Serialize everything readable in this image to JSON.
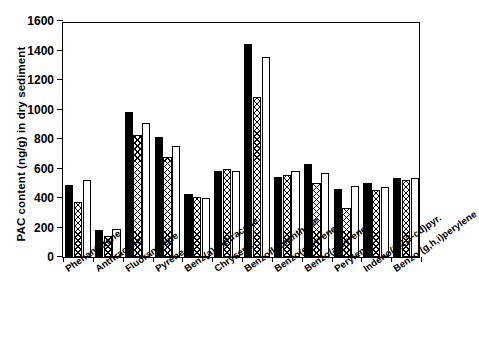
{
  "chart_data": {
    "type": "bar",
    "title": "",
    "xlabel": "",
    "ylabel": "PAC content (ng/g) in dry sediment",
    "ylim": [
      0,
      1600
    ],
    "yticks": [
      0,
      200,
      400,
      600,
      800,
      1000,
      1200,
      1400,
      1600
    ],
    "grid": false,
    "legend": "none",
    "categories": [
      "Phenanthrene",
      "Anthracene",
      "Fluoranthene",
      "Pyrene",
      "Benz(a)anthracene",
      "Chrysene",
      "Benzofluoranthene",
      "Benzo(e)pyrene",
      "Benzo(a)pyrene",
      "Perylene",
      "Indeno(1,2,3-cd)pyr.",
      "Benzo (g,h,i)perylene"
    ],
    "series": [
      {
        "name": "series-1-solid-black",
        "fill": "solid-black",
        "color": "#000000",
        "values": [
          485,
          185,
          980,
          815,
          425,
          580,
          1445,
          545,
          630,
          460,
          500,
          535
        ]
      },
      {
        "name": "series-2-crosshatch",
        "fill": "crosshatch",
        "color": "#000000",
        "values": [
          375,
          140,
          825,
          675,
          405,
          595,
          1085,
          555,
          505,
          330,
          455,
          520
        ]
      },
      {
        "name": "series-3-open-white",
        "fill": "open-white",
        "color": "#ffffff",
        "values": [
          520,
          190,
          910,
          750,
          400,
          585,
          1355,
          585,
          570,
          480,
          475,
          535
        ]
      }
    ]
  }
}
